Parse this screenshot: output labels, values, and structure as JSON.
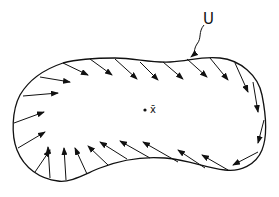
{
  "diagram": {
    "region_label": "U",
    "point_label": "x̄",
    "stroke_color": "#111111",
    "background": "#ffffff",
    "outline": "M 63 63 C 78 59, 95 58, 115 58 C 135 58, 150 63, 170 62 C 190 61, 200 56, 220 58 C 240 60, 258 75, 262 95 C 266 115, 268 135, 262 150 C 256 165, 240 172, 225 170 C 205 168, 190 160, 165 158 C 140 156, 120 160, 100 168 C 85 174, 70 183, 58 181 C 40 179, 24 168, 17 150 C 11 135, 12 110, 20 95 C 30 78, 45 69, 63 63 Z",
    "leader": "M 204 25 C 198 32, 202 38, 197 44 C 193 50, 196 53, 191 57",
    "leader_arrow_tip": [
      190,
      58
    ],
    "center": [
      145,
      110
    ],
    "arrows": [
      {
        "from": [
          63,
          63
        ],
        "to": [
          88,
          75
        ]
      },
      {
        "from": [
          90,
          59
        ],
        "to": [
          112,
          75
        ]
      },
      {
        "from": [
          115,
          59
        ],
        "to": [
          137,
          79
        ]
      },
      {
        "from": [
          140,
          62
        ],
        "to": [
          158,
          80
        ]
      },
      {
        "from": [
          163,
          62
        ],
        "to": [
          183,
          79
        ]
      },
      {
        "from": [
          187,
          59
        ],
        "to": [
          207,
          77
        ]
      },
      {
        "from": [
          210,
          58
        ],
        "to": [
          228,
          80
        ]
      },
      {
        "from": [
          235,
          63
        ],
        "to": [
          248,
          92
        ]
      },
      {
        "from": [
          253,
          82
        ],
        "to": [
          258,
          112
        ]
      },
      {
        "from": [
          264,
          120
        ],
        "to": [
          258,
          143
        ]
      },
      {
        "from": [
          258,
          152
        ],
        "to": [
          233,
          165
        ]
      },
      {
        "from": [
          228,
          170
        ],
        "to": [
          202,
          155
        ]
      },
      {
        "from": [
          205,
          168
        ],
        "to": [
          178,
          150
        ]
      },
      {
        "from": [
          178,
          162
        ],
        "to": [
          143,
          142
        ]
      },
      {
        "from": [
          150,
          158
        ],
        "to": [
          120,
          141
        ]
      },
      {
        "from": [
          127,
          159
        ],
        "to": [
          100,
          142
        ]
      },
      {
        "from": [
          108,
          165
        ],
        "to": [
          88,
          146
        ]
      },
      {
        "from": [
          87,
          174
        ],
        "to": [
          75,
          148
        ]
      },
      {
        "from": [
          66,
          180
        ],
        "to": [
          64,
          148
        ]
      },
      {
        "from": [
          50,
          178
        ],
        "to": [
          48,
          147
        ]
      },
      {
        "from": [
          35,
          172
        ],
        "to": [
          50,
          150
        ]
      },
      {
        "from": [
          18,
          148
        ],
        "to": [
          45,
          132
        ]
      },
      {
        "from": [
          14,
          123
        ],
        "to": [
          44,
          112
        ]
      },
      {
        "from": [
          23,
          96
        ],
        "to": [
          58,
          93
        ]
      },
      {
        "from": [
          40,
          77
        ],
        "to": [
          70,
          82
        ]
      }
    ]
  }
}
